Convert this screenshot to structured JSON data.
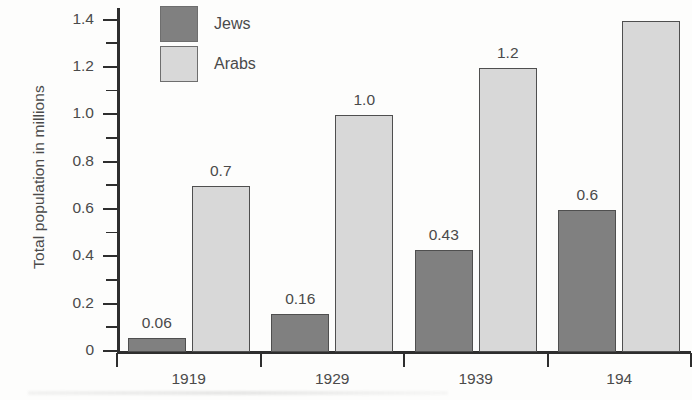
{
  "chart_data": {
    "type": "bar",
    "title": "",
    "xlabel": "",
    "ylabel": "Total population in millions",
    "categories": [
      "1919",
      "1929",
      "1939",
      "194"
    ],
    "series": [
      {
        "name": "Jews",
        "color": "#808080",
        "values": [
          0.06,
          0.16,
          0.43,
          0.6
        ]
      },
      {
        "name": "Arabs",
        "color": "#d8d8d8",
        "values": [
          0.7,
          1.0,
          1.2,
          1.4
        ]
      }
    ],
    "point_labels": {
      "Jews": [
        "0.06",
        "0.16",
        "0.43",
        "0.6"
      ],
      "Arabs": [
        "0.7",
        "1.0",
        "1.2",
        ""
      ]
    },
    "ylim": [
      0,
      1.45
    ],
    "ytick_labels": [
      "0",
      "0.2",
      "0.4",
      "0.6",
      "0.8",
      "1.0",
      "1.2",
      "1.4"
    ],
    "ytick_values": [
      0,
      0.2,
      0.4,
      0.6,
      0.8,
      1.0,
      1.2,
      1.4
    ],
    "yminor_values": [
      0.1,
      0.3,
      0.5,
      0.7,
      0.9,
      1.1,
      1.3
    ],
    "grid": false,
    "legend_position": "top-left"
  },
  "legend": {
    "items": [
      {
        "label": "Jews",
        "swatch": "jews-swatch"
      },
      {
        "label": "Arabs",
        "swatch": "arabs-swatch"
      }
    ]
  },
  "axes": {
    "y_title": "Total population in millions"
  }
}
